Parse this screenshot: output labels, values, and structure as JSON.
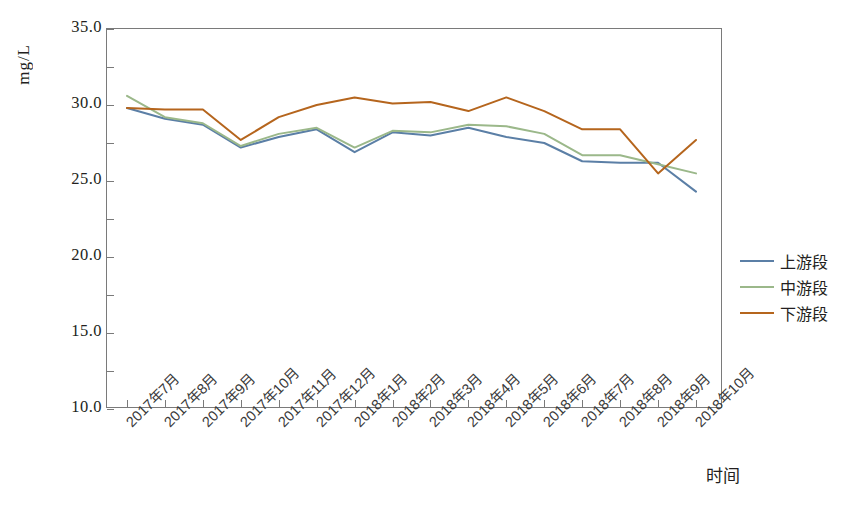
{
  "chart_data": {
    "type": "line",
    "title": "",
    "xlabel": "时间",
    "ylabel": "mg/L",
    "ylim": [
      10.0,
      35.0
    ],
    "ytick_step": 5.0,
    "yminor_step": 2.5,
    "grid": false,
    "legend_position": "right",
    "ytick_labels": [
      "35.0",
      "30.0",
      "25.0",
      "20.0",
      "15.0",
      "10.0"
    ],
    "ytick_values": [
      35.0,
      30.0,
      25.0,
      20.0,
      15.0,
      10.0
    ],
    "categories": [
      "2017年7月",
      "2017年8月",
      "2017年9月",
      "2017年10月",
      "2017年11月",
      "2017年12月",
      "2018年1月",
      "2018年2月",
      "2018年3月",
      "2018年4月",
      "2018年5月",
      "2018年6月",
      "2018年7月",
      "2018年8月",
      "2018年9月",
      "2018年10月"
    ],
    "series": [
      {
        "name": "上游段",
        "color": "#5b7fa6",
        "values": [
          29.8,
          29.1,
          28.7,
          27.2,
          27.9,
          28.4,
          26.9,
          28.2,
          28.0,
          28.5,
          27.9,
          27.5,
          26.3,
          26.2,
          26.2,
          24.3
        ]
      },
      {
        "name": "中游段",
        "color": "#9bb88a",
        "values": [
          30.6,
          29.2,
          28.8,
          27.3,
          28.1,
          28.5,
          27.2,
          28.3,
          28.2,
          28.7,
          28.6,
          28.1,
          26.7,
          26.7,
          26.1,
          25.5
        ]
      },
      {
        "name": "下游段",
        "color": "#b5651d",
        "values": [
          29.8,
          29.7,
          29.7,
          27.7,
          29.2,
          30.0,
          30.5,
          30.1,
          30.2,
          29.6,
          30.5,
          29.6,
          28.4,
          28.4,
          25.5,
          27.7
        ]
      }
    ]
  },
  "legend": {
    "items": [
      {
        "label": "上游段",
        "color": "#5b7fa6"
      },
      {
        "label": "中游段",
        "color": "#9bb88a"
      },
      {
        "label": "下游段",
        "color": "#b5651d"
      }
    ]
  }
}
